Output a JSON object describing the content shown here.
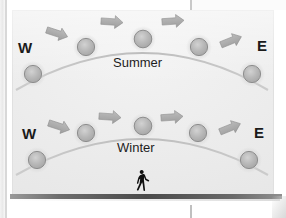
{
  "diagram": {
    "panel_background": "#e9e9e9",
    "ground_color": "#4a4a4a",
    "sun_color": "#b4b4b4",
    "arc_color": "#c2c2c2",
    "arrow_color": "#aaaaaa",
    "text_color": "#1b1b1b",
    "paths": [
      {
        "id": "summer-path",
        "season_label": "Summer",
        "west_label": "W",
        "east_label": "E",
        "sun_count": 5,
        "arrow_count": 4,
        "direction": "east-to-west"
      },
      {
        "id": "winter-path",
        "season_label": "Winter",
        "west_label": "W",
        "east_label": "E",
        "sun_count": 5,
        "arrow_count": 4,
        "direction": "east-to-west"
      }
    ],
    "observer": {
      "icon": "walking-person-icon",
      "label": "observer"
    }
  }
}
